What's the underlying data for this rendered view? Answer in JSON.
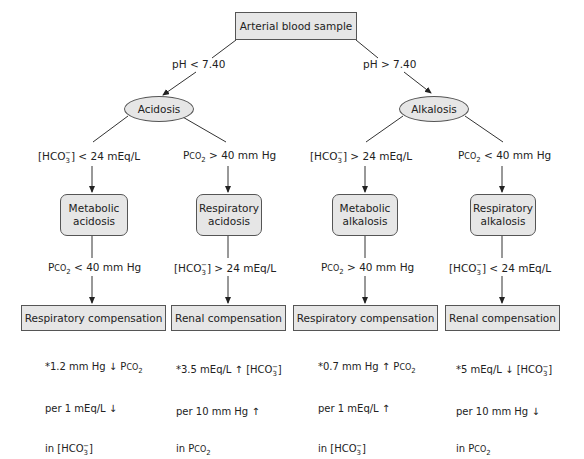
{
  "diagram": {
    "root": {
      "label": "Arterial blood sample"
    },
    "branches": [
      {
        "condition": "pH < 7.40",
        "state": "Acidosis",
        "children": [
          {
            "condition": "[HCO3-] < 24 mEq/L",
            "disorder_line1": "Metabolic",
            "disorder_line2": "acidosis",
            "compensation_trigger": "PCO2 < 40 mm Hg",
            "compensation": "Respiratory compensation",
            "note_line1": "*1.2 mm Hg ↓ PCO2",
            "note_line2": "per 1 mEq/L ↓",
            "note_line3": "in [HCO3-]"
          },
          {
            "condition": "PCO2 > 40 mm Hg",
            "disorder_line1": "Respiratory",
            "disorder_line2": "acidosis",
            "compensation_trigger": "[HCO3-] > 24 mEq/L",
            "compensation": "Renal compensation",
            "note_line1": "*3.5 mEq/L ↑ [HCO3-]",
            "note_line2": "per 10 mm Hg ↑",
            "note_line3": "in PCO2"
          }
        ]
      },
      {
        "condition": "pH > 7.40",
        "state": "Alkalosis",
        "children": [
          {
            "condition": "[HCO3-] > 24 mEq/L",
            "disorder_line1": "Metabolic",
            "disorder_line2": "alkalosis",
            "compensation_trigger": "PCO2 > 40 mm Hg",
            "compensation": "Respiratory compensation",
            "note_line1": "*0.7 mm Hg ↑ PCO2",
            "note_line2": "per 1 mEq/L ↑",
            "note_line3": "in [HCO3-]"
          },
          {
            "condition": "PCO2 < 40 mm Hg",
            "disorder_line1": "Respiratory",
            "disorder_line2": "alkalosis",
            "compensation_trigger": "[HCO3-] < 24 mEq/L",
            "compensation": "Renal compensation",
            "note_line1": "*5 mEq/L ↓ [HCO3-]",
            "note_line2": "per 10 mm Hg ↓",
            "note_line3": "in PCO2"
          }
        ]
      }
    ],
    "colors": {
      "node_fill": "#e6e6e6",
      "node_border": "#555555",
      "line": "#333333"
    }
  }
}
